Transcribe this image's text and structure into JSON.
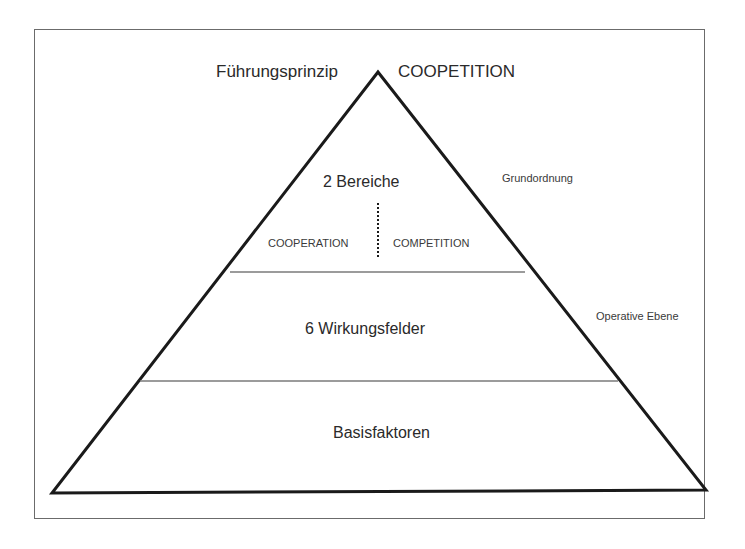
{
  "diagram": {
    "header": {
      "left_label": "Führungsprinzip",
      "right_label": "COOPETITION"
    },
    "levels": [
      {
        "title": "2 Bereiche",
        "side_label": "Grundordnung",
        "split": [
          "COOPERATION",
          "COMPETITION"
        ]
      },
      {
        "title": "6 Wirkungsfelder",
        "side_label": "Operative Ebene"
      },
      {
        "title": "Basisfaktoren"
      }
    ],
    "colors": {
      "outline": "#1a1a1a",
      "divider": "#7a7a7a",
      "frame": "#6b6b6b",
      "text": "#2a2a2a"
    }
  }
}
